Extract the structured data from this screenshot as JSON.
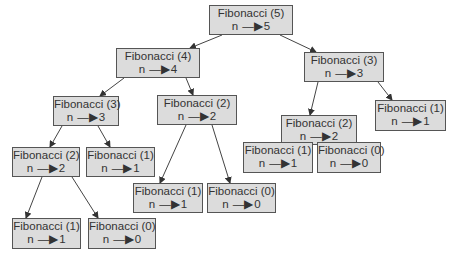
{
  "diagram": {
    "nodes": [
      {
        "id": "f5",
        "title": "Fibonacci (5)",
        "n": "n",
        "arrow": "—▶",
        "value": "5",
        "x": 209,
        "y": 5,
        "w": 84,
        "h": 30
      },
      {
        "id": "f4",
        "title": "Fibonacci (4)",
        "n": "n",
        "arrow": "—▶",
        "value": "4",
        "x": 116,
        "y": 48,
        "w": 84,
        "h": 30
      },
      {
        "id": "f3r",
        "title": "Fibonacci (3)",
        "n": "n",
        "arrow": "—▶",
        "value": "3",
        "x": 304,
        "y": 52,
        "w": 80,
        "h": 30
      },
      {
        "id": "f3l",
        "title": "Fibonacci (3)",
        "n": "n",
        "arrow": "—▶",
        "value": "3",
        "x": 53,
        "y": 96,
        "w": 66,
        "h": 30
      },
      {
        "id": "f2m",
        "title": "Fibonacci (2)",
        "n": "n",
        "arrow": "—▶",
        "value": "2",
        "x": 157,
        "y": 95,
        "w": 80,
        "h": 30
      },
      {
        "id": "f2r",
        "title": "Fibonacci (2)",
        "n": "n",
        "arrow": "—▶",
        "value": "2",
        "x": 281,
        "y": 115,
        "w": 76,
        "h": 30
      },
      {
        "id": "f1rr",
        "title": "Fibonacci (1)",
        "n": "n",
        "arrow": "—▶",
        "value": "1",
        "x": 375,
        "y": 100,
        "w": 71,
        "h": 31
      },
      {
        "id": "f2l",
        "title": "Fibonacci (2)",
        "n": "n",
        "arrow": "—▶",
        "value": "2",
        "x": 12,
        "y": 147,
        "w": 68,
        "h": 30
      },
      {
        "id": "f1l",
        "title": "Fibonacci (1)",
        "n": "n",
        "arrow": "—▶",
        "value": "1",
        "x": 86,
        "y": 147,
        "w": 69,
        "h": 30
      },
      {
        "id": "f1m",
        "title": "Fibonacci (1)",
        "n": "n",
        "arrow": "—▶",
        "value": "1",
        "x": 133,
        "y": 183,
        "w": 70,
        "h": 30
      },
      {
        "id": "f0m",
        "title": "Fibonacci (0)",
        "n": "n",
        "arrow": "—▶",
        "value": "0",
        "x": 207,
        "y": 183,
        "w": 69,
        "h": 30
      },
      {
        "id": "f1rb",
        "title": "Fibonacci (1)",
        "n": "n",
        "arrow": "—▶",
        "value": "1",
        "x": 243,
        "y": 142,
        "w": 70,
        "h": 31
      },
      {
        "id": "f0rb",
        "title": "Fibonacci (0)",
        "n": "n",
        "arrow": "—▶",
        "value": "0",
        "x": 317,
        "y": 142,
        "w": 64,
        "h": 31
      },
      {
        "id": "f1lb",
        "title": "Fibonacci (1)",
        "n": "n",
        "arrow": "—▶",
        "value": "1",
        "x": 12,
        "y": 218,
        "w": 69,
        "h": 31
      },
      {
        "id": "f0lb",
        "title": "Fibonacci (0)",
        "n": "n",
        "arrow": "—▶",
        "value": "0",
        "x": 88,
        "y": 218,
        "w": 68,
        "h": 31
      }
    ],
    "edges": [
      {
        "from": "f5",
        "to": "f4",
        "x1": 222,
        "y1": 35,
        "x2": 190,
        "y2": 48
      },
      {
        "from": "f5",
        "to": "f3r",
        "x1": 280,
        "y1": 35,
        "x2": 316,
        "y2": 52
      },
      {
        "from": "f4",
        "to": "f3l",
        "x1": 124,
        "y1": 78,
        "x2": 100,
        "y2": 96
      },
      {
        "from": "f4",
        "to": "f2m",
        "x1": 186,
        "y1": 78,
        "x2": 193,
        "y2": 95
      },
      {
        "from": "f3r",
        "to": "f2r",
        "x1": 318,
        "y1": 82,
        "x2": 310,
        "y2": 115
      },
      {
        "from": "f3r",
        "to": "f1rr",
        "x1": 378,
        "y1": 82,
        "x2": 392,
        "y2": 100
      },
      {
        "from": "f3l",
        "to": "f2l",
        "x1": 62,
        "y1": 126,
        "x2": 50,
        "y2": 147
      },
      {
        "from": "f3l",
        "to": "f1l",
        "x1": 98,
        "y1": 126,
        "x2": 110,
        "y2": 147
      },
      {
        "from": "f2m",
        "to": "f1m",
        "x1": 186,
        "y1": 125,
        "x2": 160,
        "y2": 183
      },
      {
        "from": "f2m",
        "to": "f0m",
        "x1": 212,
        "y1": 125,
        "x2": 230,
        "y2": 183
      },
      {
        "from": "f2r",
        "to": "f1rb",
        "x1": 290,
        "y1": 145,
        "x2": 283,
        "y2": 156
      },
      {
        "from": "f2r",
        "to": "f0rb",
        "x1": 338,
        "y1": 145,
        "x2": 344,
        "y2": 156
      },
      {
        "from": "f2l",
        "to": "f1lb",
        "x1": 42,
        "y1": 177,
        "x2": 26,
        "y2": 218
      },
      {
        "from": "f2l",
        "to": "f0lb",
        "x1": 72,
        "y1": 177,
        "x2": 98,
        "y2": 218
      }
    ],
    "colors": {
      "box_fill": "#dcdcdc",
      "box_border": "#555555",
      "edge": "#444444",
      "text": "#333333"
    }
  }
}
